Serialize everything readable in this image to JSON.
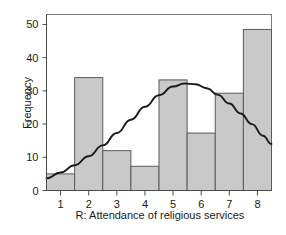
{
  "chart_data": {
    "type": "bar",
    "title": "",
    "subtitle": "",
    "xlabel": "R: Attendance of religious services",
    "ylabel": "Frequency",
    "categories": [
      "1",
      "2",
      "3",
      "4",
      "5",
      "6",
      "7",
      "8"
    ],
    "values": [
      5,
      34,
      12,
      7.3,
      33.3,
      17.3,
      29.3,
      48.5
    ],
    "xlim": [
      0.5,
      8.5
    ],
    "ylim": [
      0,
      53
    ],
    "xticks": [
      "1",
      "2",
      "3",
      "4",
      "5",
      "6",
      "7",
      "8"
    ],
    "yticks": [
      "0",
      "10",
      "20",
      "30",
      "40",
      "50"
    ],
    "grid": false,
    "legend": false,
    "legend_position": "none",
    "bar_fill_color": "#c9c9c9",
    "bar_edge_color": "#5a5a5a",
    "overlay": {
      "name": "normal-curve",
      "type": "line",
      "color": "#1a1a1a",
      "description": "fitted normal density curve scaled to frequency",
      "x": [
        0.5,
        1.0,
        1.5,
        2.0,
        2.5,
        3.0,
        3.5,
        4.0,
        4.5,
        5.0,
        5.4,
        5.8,
        6.2,
        6.6,
        7.0,
        7.4,
        7.8,
        8.2,
        8.5
      ],
      "y": [
        3.7,
        5.4,
        7.6,
        10.3,
        13.6,
        17.3,
        21.3,
        25.2,
        28.7,
        31.3,
        32.2,
        32.0,
        30.8,
        28.8,
        26.2,
        23.2,
        20.0,
        16.5,
        14.0
      ]
    }
  },
  "axes": {
    "y_axis_label": "Frequency",
    "x_axis_label": "R: Attendance of religious services"
  }
}
